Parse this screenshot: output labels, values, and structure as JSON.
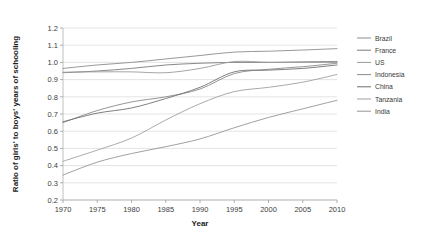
{
  "chart_data": {
    "type": "line",
    "title": "",
    "xlabel": "Year",
    "ylabel": "Ratio of girls' to boys' years of schooling",
    "x": [
      1970,
      1975,
      1980,
      1985,
      1990,
      1995,
      2000,
      2005,
      2010
    ],
    "xlim": [
      1970,
      2010
    ],
    "ylim": [
      0.2,
      1.2
    ],
    "xticks": [
      "1970",
      "1975",
      "1980",
      "1985",
      "1990",
      "1995",
      "2000",
      "2005",
      "2010"
    ],
    "yticks": [
      "0.2",
      "0.3",
      "0.4",
      "0.5",
      "0.6",
      "0.7",
      "0.8",
      "0.9",
      "1.0",
      "1.1",
      "1.2"
    ],
    "grid": true,
    "legend_position": "right",
    "series": [
      {
        "name": "Brazil",
        "color": "#8c8c8c",
        "values": [
          0.965,
          0.985,
          1.0,
          1.02,
          1.04,
          1.06,
          1.065,
          1.072,
          1.08
        ]
      },
      {
        "name": "France",
        "color": "#7a7a7a",
        "values": [
          0.94,
          0.95,
          0.965,
          0.985,
          0.995,
          1.0,
          1.0,
          1.003,
          1.005
        ]
      },
      {
        "name": "US",
        "color": "#9a9a9a",
        "values": [
          0.943,
          0.945,
          0.945,
          0.94,
          0.965,
          1.005,
          1.0,
          1.0,
          1.0
        ]
      },
      {
        "name": "Indonesia",
        "color": "#8a8a8a",
        "values": [
          0.65,
          0.72,
          0.77,
          0.8,
          0.845,
          0.935,
          0.96,
          0.975,
          0.995
        ]
      },
      {
        "name": "China",
        "color": "#707070",
        "values": [
          0.655,
          0.705,
          0.735,
          0.79,
          0.855,
          0.945,
          0.955,
          0.965,
          0.985
        ]
      },
      {
        "name": "Tanzania",
        "color": "#a0a0a0",
        "values": [
          0.425,
          0.49,
          0.56,
          0.665,
          0.76,
          0.83,
          0.855,
          0.885,
          0.93
        ]
      },
      {
        "name": "India",
        "color": "#959595",
        "values": [
          0.345,
          0.42,
          0.47,
          0.51,
          0.555,
          0.62,
          0.68,
          0.73,
          0.78
        ]
      }
    ]
  }
}
